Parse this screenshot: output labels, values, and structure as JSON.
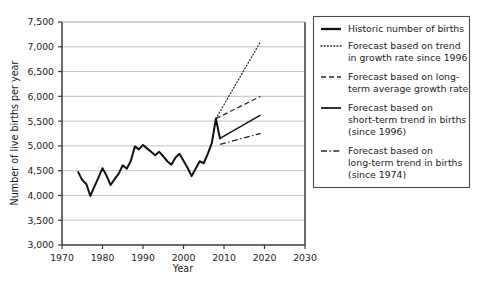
{
  "chart_data": {
    "type": "line",
    "title": "",
    "xlabel": "Year",
    "ylabel": "Number of live births per year",
    "xlim": [
      1970,
      2030
    ],
    "ylim": [
      3000,
      7500
    ],
    "xticks": [
      1970,
      1980,
      1990,
      2000,
      2010,
      2020,
      2030
    ],
    "xtick_labels": [
      "1970",
      "1980",
      "1990",
      "2000",
      "2010",
      "2020",
      "2030"
    ],
    "yticks": [
      3000,
      3500,
      4000,
      4500,
      5000,
      5500,
      6000,
      6500,
      7000,
      7500
    ],
    "ytick_labels": [
      "3,000",
      "3,500",
      "4,000",
      "4,500",
      "5,000",
      "5,500",
      "6,000",
      "6,500",
      "7,000",
      "7,500"
    ],
    "grid": "horizontal",
    "legend_position": "right-outside",
    "series": [
      {
        "name": "Historic number of births",
        "style": "solid-thick",
        "x": [
          1974,
          1975,
          1976,
          1977,
          1978,
          1979,
          1980,
          1981,
          1982,
          1983,
          1984,
          1985,
          1986,
          1987,
          1988,
          1989,
          1990,
          1991,
          1992,
          1993,
          1994,
          1995,
          1996,
          1997,
          1998,
          1999,
          2000,
          2001,
          2002,
          2003,
          2004,
          2005,
          2006,
          2007,
          2008,
          2009
        ],
        "values": [
          4470,
          4310,
          4230,
          3990,
          4180,
          4360,
          4550,
          4400,
          4210,
          4330,
          4440,
          4610,
          4540,
          4700,
          4990,
          4930,
          5020,
          4950,
          4880,
          4810,
          4880,
          4790,
          4690,
          4620,
          4760,
          4840,
          4700,
          4560,
          4390,
          4540,
          4690,
          4650,
          4840,
          5060,
          5550,
          5150
        ]
      },
      {
        "name": "Forecast based on trend in growth rate since 1996",
        "style": "dotted",
        "x": [
          2008,
          2019
        ],
        "values": [
          5550,
          7100
        ]
      },
      {
        "name": "Forecast based on long-term average growth rate",
        "style": "dashed",
        "x": [
          2008,
          2019
        ],
        "values": [
          5550,
          6000
        ]
      },
      {
        "name": "Forecast based on short-term trend in births (since 1996)",
        "style": "solid-thin",
        "x": [
          2009,
          2019
        ],
        "values": [
          5150,
          5620
        ]
      },
      {
        "name": "Forecast based on long-term trend in births (since 1974)",
        "style": "dash-dot",
        "x": [
          2009,
          2019
        ],
        "values": [
          5030,
          5250
        ]
      }
    ]
  },
  "legend": {
    "items": [
      {
        "label_line1": "Historic number of births",
        "label_line2": "",
        "label_line3": ""
      },
      {
        "label_line1": "Forecast based on trend",
        "label_line2": "in growth rate since 1996",
        "label_line3": ""
      },
      {
        "label_line1": "Forecast based on long-",
        "label_line2": "term average growth rate",
        "label_line3": ""
      },
      {
        "label_line1": "Forecast based on",
        "label_line2": "short-term trend in births",
        "label_line3": "(since 1996)"
      },
      {
        "label_line1": "Forecast based on",
        "label_line2": "long-term trend in births",
        "label_line3": "(since 1974)"
      }
    ]
  },
  "colors": {
    "line": "#121212",
    "grid": "#b4b4b4",
    "axis": "#3a3a3a",
    "text": "#1b1b1b",
    "background": "#ffffff"
  }
}
